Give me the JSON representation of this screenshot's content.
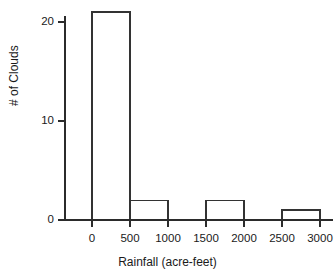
{
  "chart_data": {
    "type": "bar",
    "title": "",
    "subtitle": "",
    "xlabel": "Rainfall (acre-feet)",
    "ylabel": "# of Clouds",
    "grid": false,
    "legend": null,
    "bin_width": 500,
    "xlim": [
      0,
      3000
    ],
    "ylim": [
      0,
      22
    ],
    "xticks": [
      0,
      500,
      1000,
      1500,
      2000,
      2500,
      3000
    ],
    "xtick_labels": [
      "0",
      "500",
      "1000",
      "1500",
      "2000",
      "2500",
      "3000"
    ],
    "yticks": [
      0,
      10,
      20
    ],
    "ytick_labels": [
      "0",
      "10",
      "20"
    ],
    "categories": [
      "0-500",
      "500-1000",
      "1000-1500",
      "1500-2000",
      "2000-2500",
      "2500-3000"
    ],
    "bins": [
      {
        "start": 0,
        "end": 500,
        "value": 21
      },
      {
        "start": 500,
        "end": 1000,
        "value": 2
      },
      {
        "start": 1000,
        "end": 1500,
        "value": 0
      },
      {
        "start": 1500,
        "end": 2000,
        "value": 2
      },
      {
        "start": 2000,
        "end": 2500,
        "value": 0
      },
      {
        "start": 2500,
        "end": 3000,
        "value": 1
      }
    ],
    "values": [
      21,
      2,
      0,
      2,
      0,
      1
    ],
    "colors": {
      "axis": "#2b2b2b",
      "bar_stroke": "#333333",
      "bar_fill": "#ffffff",
      "text": "#1a1a1a",
      "background": "#ffffff"
    }
  }
}
